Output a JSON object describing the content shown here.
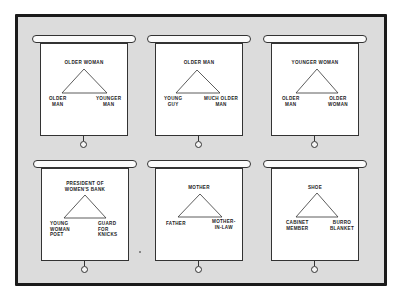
{
  "figure": {
    "colors": {
      "frame_border": "#1a1a1a",
      "frame_fill": "#dcdcdc",
      "screen_fill": "#ffffff",
      "line": "#333333"
    }
  },
  "panels": [
    {
      "top": "OLDER WOMAN",
      "left": "OLDER\nMAN",
      "right": "YOUNGER\nMAN"
    },
    {
      "top": "OLDER MAN",
      "left": "YOUNG\nGUY",
      "right": "MUCH OLDER\nMAN"
    },
    {
      "top": "YOUNGER WOMAN",
      "left": "OLDER\nMAN",
      "right": "OLDER\nWOMAN"
    },
    {
      "top": "PRESIDENT OF\nWOMEN'S BANK",
      "left": "YOUNG\nWOMAN\nPOET",
      "right": "GUARD\nFOR\nKNICKS"
    },
    {
      "top": "MOTHER",
      "left": "FATHER",
      "right": "MOTHER-\nIN-LAW"
    },
    {
      "top": "SHOE",
      "left": "CABINET\nMEMBER",
      "right": "BURRO\nBLANKET"
    }
  ]
}
